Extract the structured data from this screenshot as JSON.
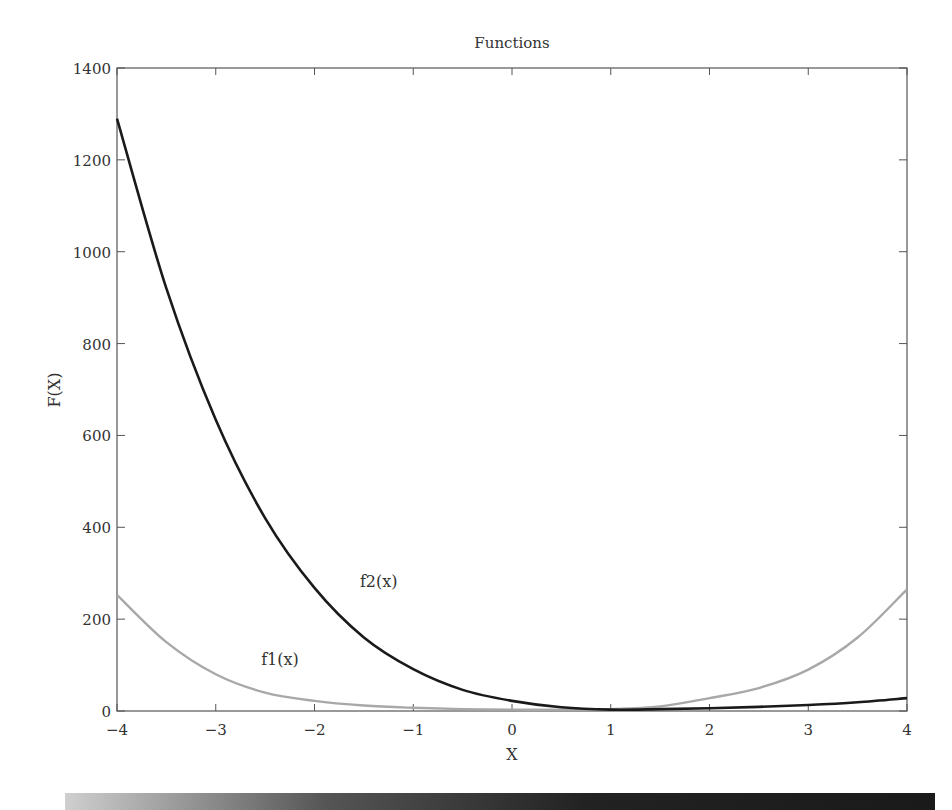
{
  "chart_data": {
    "type": "line",
    "title": "Functions",
    "xlabel": "X",
    "ylabel": "F(X)",
    "xlim": [
      -4,
      4
    ],
    "ylim": [
      0,
      1400
    ],
    "grid": false,
    "legend": null,
    "x_ticks": [
      -4,
      -3,
      -2,
      -1,
      0,
      1,
      2,
      3,
      4
    ],
    "x_tick_labels": [
      "−4",
      "−3",
      "−2",
      "−1",
      "0",
      "1",
      "2",
      "3",
      "4"
    ],
    "y_ticks": [
      0,
      200,
      400,
      600,
      800,
      1000,
      1200,
      1400
    ],
    "y_tick_labels": [
      "0",
      "200",
      "400",
      "600",
      "800",
      "1000",
      "1200",
      "1400"
    ],
    "x": [
      -4,
      -3.5,
      -3,
      -2.5,
      -2,
      -1.5,
      -1,
      -0.5,
      0,
      0.5,
      1,
      1.5,
      2,
      2.5,
      3,
      3.5,
      4
    ],
    "series": [
      {
        "name": "f1(x)",
        "color": "#a8a8a8",
        "values": [
          253,
          150,
          80,
          40,
          22,
          12,
          7,
          4,
          3,
          3,
          4,
          10,
          28,
          50,
          90,
          160,
          265
        ]
      },
      {
        "name": "f2(x)",
        "color": "#1a1a1a",
        "values": [
          1290,
          920,
          634,
          420,
          268,
          160,
          91,
          46,
          22,
          8,
          3,
          4,
          6,
          9,
          13,
          19,
          28
        ]
      }
    ],
    "annotations": [
      {
        "text": "f1(x)",
        "x": -2.35,
        "y": 100
      },
      {
        "text": "f2(x)",
        "x": -1.35,
        "y": 270
      }
    ]
  }
}
